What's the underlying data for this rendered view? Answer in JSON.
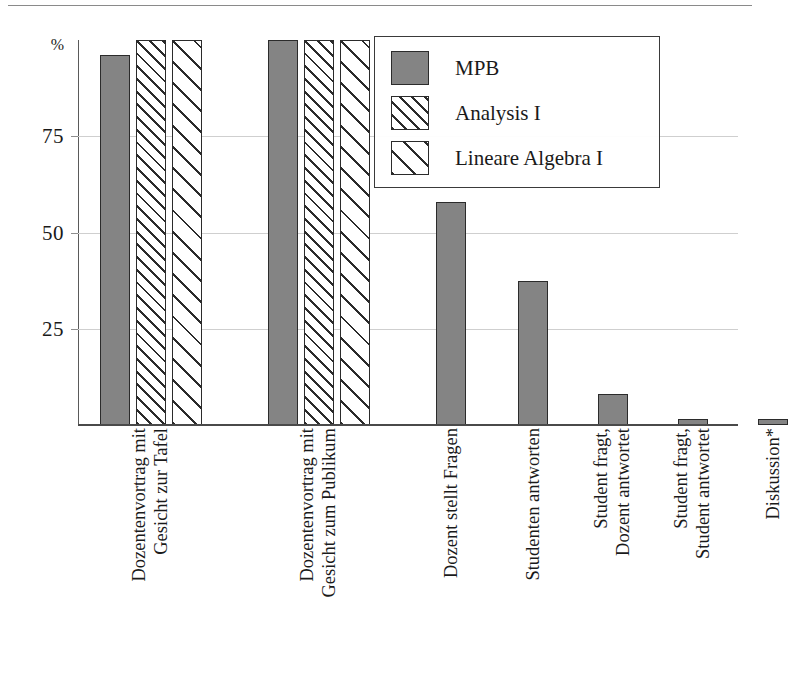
{
  "chart_data": {
    "type": "bar",
    "title": "",
    "subtitle": "",
    "xlabel": "",
    "ylabel": "%",
    "ylim": [
      0,
      100
    ],
    "yticks": [
      25,
      50,
      75
    ],
    "ytick_labels": [
      "25",
      "50",
      "75"
    ],
    "grid": true,
    "legend_position": "top-right",
    "categories": [
      "Dozentenvortrag mit Gesicht zur Tafel",
      "Dozentenvortrag mit Gesicht zum Publikum",
      "Dozent stellt Fragen",
      "Studenten antworten",
      "Student fragt, Dozent antwortet",
      "Student fragt, Student antwortet",
      "Diskussion*"
    ],
    "category_lines": [
      [
        "Dozentenvortrag mit",
        "Gesicht zur Tafel"
      ],
      [
        "Dozentenvortrag mit",
        "Gesicht zum Publikum"
      ],
      [
        "Dozent stellt Fragen",
        ""
      ],
      [
        "Studenten antworten",
        ""
      ],
      [
        "Student fragt,",
        "Dozent antwortet"
      ],
      [
        "Student fragt,",
        "Student antwortet"
      ],
      [
        "Diskussion*",
        ""
      ]
    ],
    "series": [
      {
        "name": "MPB",
        "pattern": "solid",
        "color": "#848484",
        "values": [
          96,
          100,
          58,
          37.5,
          8,
          1.5,
          1.5
        ]
      },
      {
        "name": "Analysis I",
        "pattern": "hatch-narrow",
        "color": "#ffffff",
        "values": [
          100,
          100,
          null,
          null,
          null,
          null,
          null
        ]
      },
      {
        "name": "Lineare Algebra I",
        "pattern": "hatch-wide",
        "color": "#ffffff",
        "values": [
          100,
          100,
          null,
          null,
          null,
          null,
          null
        ]
      }
    ]
  },
  "axis": {
    "y_unit": "%",
    "tick_75": "75",
    "tick_50": "50",
    "tick_25": "25"
  },
  "legend": {
    "items": [
      {
        "label": "MPB",
        "pattern": "solid"
      },
      {
        "label": "Analysis I",
        "pattern": "hatch-a"
      },
      {
        "label": "Lineare Algebra I",
        "pattern": "hatch-b"
      }
    ]
  },
  "colors": {
    "bar_fill": "#848484",
    "bar_stroke": "#2b2b2b",
    "gridline": "#cfcfcf",
    "axis": "#4a4a4a",
    "background": "#ffffff"
  }
}
